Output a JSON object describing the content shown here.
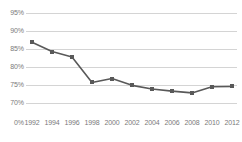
{
  "chart_data": {
    "type": "line",
    "title": "",
    "subtitle": "",
    "xlabel": "",
    "ylabel": "",
    "categories": [
      "1992",
      "1994",
      "1996",
      "1998",
      "2000",
      "2002",
      "2004",
      "2006",
      "2008",
      "2010",
      "2012"
    ],
    "values": [
      86.9,
      84.3,
      82.8,
      75.7,
      76.8,
      74.9,
      73.9,
      73.3,
      72.8,
      74.5,
      74.6
    ],
    "series": [
      {
        "name": "",
        "values": [
          86.9,
          84.3,
          82.8,
          75.7,
          76.8,
          74.9,
          73.9,
          73.3,
          72.8,
          74.5,
          74.6
        ]
      }
    ],
    "y_tick_labels": [
      "95%",
      "90%",
      "85%",
      "80%",
      "75%",
      "70%",
      "0%"
    ],
    "y_tick_values": [
      95,
      90,
      85,
      80,
      75,
      70,
      0
    ],
    "x_tick_labels": [
      "1992",
      "1994",
      "1996",
      "1998",
      "2000",
      "2002",
      "2004",
      "2006",
      "2008",
      "2010",
      "2012"
    ],
    "ylim": [
      70,
      95
    ],
    "axis_truncated": true,
    "grid": true,
    "legend": false,
    "legend_position": "none",
    "annotations": [],
    "colors": {
      "line": "#595959",
      "marker": "#595959",
      "gridline": "#d4d4d4",
      "tick_label": "#7a7a7a",
      "background": "#ffffff"
    },
    "marker_shape": "square"
  }
}
